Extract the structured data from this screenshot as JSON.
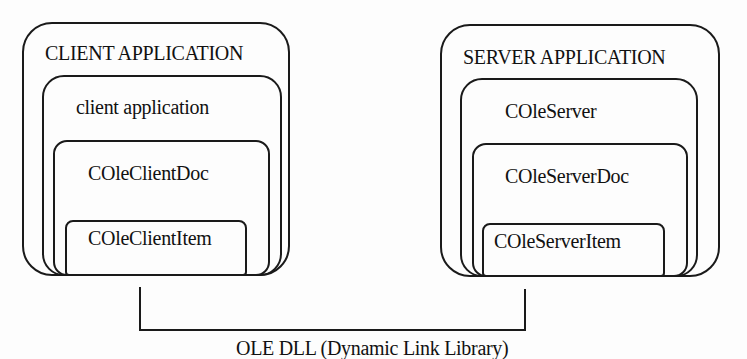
{
  "client": {
    "title": "CLIENT APPLICATION",
    "layer1": "client application",
    "layer2": "COleClientDoc",
    "layer3": "COleClientItem"
  },
  "server": {
    "title": "SERVER APPLICATION",
    "layer1": "COleServer",
    "layer2": "COleServerDoc",
    "layer3": "COleServerItem"
  },
  "connector": {
    "label": "OLE DLL (Dynamic Link Library)"
  }
}
